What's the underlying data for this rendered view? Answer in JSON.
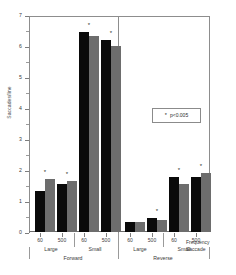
{
  "chart_data": {
    "type": "bar",
    "title": "",
    "xlabel": "",
    "ylabel": "Saccades/line",
    "ylim": [
      0,
      7
    ],
    "yticks": [
      0,
      1,
      2,
      3,
      4,
      5,
      6,
      7
    ],
    "ytick_labels": [
      "0",
      "1",
      "2",
      "3",
      "4",
      "5",
      "6",
      "7"
    ],
    "grid": false,
    "legend_position": "inside-upper-right",
    "annotations": [
      {
        "text": "p<0.005",
        "marker": "*",
        "kind": "significance-legend"
      }
    ],
    "group_axis": {
      "direction_labels": [
        "Forward",
        "Reverse"
      ],
      "saccade_size_labels": [
        "Large",
        "Small",
        "Large",
        "Small"
      ],
      "frequency_labels": [
        "60",
        "500",
        "60",
        "500",
        "60",
        "500",
        "60",
        "500"
      ],
      "axis_title_line1": "Frequency",
      "axis_title_line2": "Saccade"
    },
    "series": [
      {
        "name": "black-series",
        "color": "#0a0a0a",
        "values": [
          1.35,
          1.55,
          6.52,
          6.25,
          0.32,
          0.45,
          1.8,
          1.8
        ]
      },
      {
        "name": "gray-series",
        "color": "#6d6d6d",
        "values": [
          1.72,
          1.67,
          6.38,
          6.05,
          0.34,
          0.39,
          1.57,
          1.92
        ]
      }
    ],
    "categories": [
      "Forward / Large / 60",
      "Forward / Large / 500",
      "Forward / Small / 60",
      "Forward / Small / 500",
      "Reverse / Large / 60",
      "Reverse / Large / 500",
      "Reverse / Small / 60",
      "Reverse / Small / 500"
    ],
    "significance_markers": [
      {
        "group_index": 0,
        "star": "*"
      },
      {
        "group_index": 1,
        "star": "*"
      },
      {
        "group_index": 2,
        "star": "*"
      },
      {
        "group_index": 3,
        "star": "*"
      },
      {
        "group_index": 5,
        "star": "*"
      },
      {
        "group_index": 6,
        "star": "*"
      },
      {
        "group_index": 7,
        "star": "*"
      }
    ]
  },
  "axis": {
    "y_title": "Saccades/line",
    "y_ticks": [
      "7",
      "6",
      "5",
      "4",
      "3",
      "2",
      "1",
      "0"
    ],
    "freq": [
      "60",
      "500",
      "60",
      "500",
      "60",
      "500",
      "60",
      "500"
    ],
    "size": [
      "Large",
      "Small",
      "Large",
      "Small"
    ],
    "direction": [
      "Forward",
      "Reverse"
    ],
    "title_freq": "Frequency",
    "title_sacc": "Saccade"
  },
  "legend": {
    "star": "*",
    "text": "p<0.005"
  }
}
